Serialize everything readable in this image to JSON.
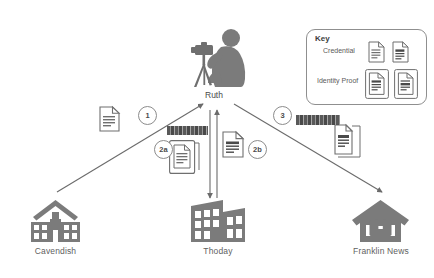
{
  "diagram": {
    "actor": {
      "name": "Ruth",
      "icon": "photographer-icon"
    },
    "nodes": [
      {
        "id": "cavendish",
        "label": "Cavendish",
        "icon": "school-building-icon"
      },
      {
        "id": "thoday",
        "label": "Thoday",
        "icon": "office-building-icon"
      },
      {
        "id": "franklin-news",
        "label": "Franklin News",
        "icon": "house-briefcase-icon"
      }
    ],
    "steps": [
      {
        "id": "step-1",
        "label": "1"
      },
      {
        "id": "step-2a",
        "label": "2a"
      },
      {
        "id": "step-2b",
        "label": "2b"
      },
      {
        "id": "step-3",
        "label": "3"
      }
    ],
    "key": {
      "title": "Key",
      "rows": [
        {
          "id": "credential",
          "label": "Credential",
          "icons": [
            "document-icon",
            "document-icon"
          ]
        },
        {
          "id": "identity-proof",
          "label": "Identity Proof",
          "icons": [
            "id-card-icon",
            "id-card-icon"
          ]
        }
      ]
    },
    "artifacts": [
      {
        "id": "artifact-credential-cavendish",
        "icon": "document-icon",
        "near": "step-1"
      },
      {
        "id": "artifact-idproof-thoday",
        "icon": "id-card-icon",
        "near": "step-2a"
      },
      {
        "id": "artifact-credential-thoday",
        "icon": "document-icon",
        "near": "step-2b"
      },
      {
        "id": "artifact-idproof-franklin",
        "icon": "id-card-icon",
        "near": "step-3"
      }
    ],
    "redacted_labels": [
      {
        "id": "redacted-label-2a",
        "text": ""
      },
      {
        "id": "redacted-label-3",
        "text": ""
      }
    ],
    "colors": {
      "ink": "#7b7b7b",
      "line": "#6b6b6b",
      "text": "#4a4a4a",
      "label": "#5f5f5f",
      "background": "#ffffff"
    }
  }
}
